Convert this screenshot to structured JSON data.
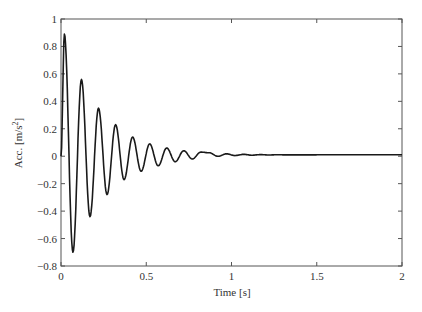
{
  "chart_data": {
    "type": "line",
    "title": "",
    "xlabel": "Time [s]",
    "ylabel": "Acc. [m/s²]",
    "ylabel_base": "Acc. [m/s",
    "ylabel_sup": "2",
    "ylabel_tail": "]",
    "xlim": [
      0,
      2
    ],
    "ylim": [
      -0.8,
      1
    ],
    "xticks": [
      0,
      0.5,
      1,
      1.5,
      2
    ],
    "xtick_labels": [
      "0",
      "0.5",
      "1",
      "1.5",
      "2"
    ],
    "yticks": [
      -0.8,
      -0.6,
      -0.4,
      -0.2,
      0,
      0.2,
      0.4,
      0.6,
      0.8,
      1
    ],
    "ytick_labels": [
      "−0.8",
      "−0.6",
      "−0.4",
      "−0.2",
      "0",
      "0.2",
      "0.4",
      "0.6",
      "0.8",
      "1"
    ],
    "grid": false,
    "legend": null,
    "line_color": "#1a1a1a",
    "series": [
      {
        "name": "acceleration",
        "description": "damped oscillation, period ≈ 0.1 s, settles to ≈ 0.01",
        "peaks": [
          {
            "x": 0.02,
            "y": 0.89
          },
          {
            "x": 0.12,
            "y": 0.56
          },
          {
            "x": 0.22,
            "y": 0.35
          },
          {
            "x": 0.32,
            "y": 0.23
          },
          {
            "x": 0.42,
            "y": 0.14
          },
          {
            "x": 0.52,
            "y": 0.09
          },
          {
            "x": 0.62,
            "y": 0.06
          },
          {
            "x": 0.72,
            "y": 0.04
          },
          {
            "x": 0.82,
            "y": 0.03
          }
        ],
        "troughs": [
          {
            "x": 0.07,
            "y": -0.7
          },
          {
            "x": 0.17,
            "y": -0.44
          },
          {
            "x": 0.27,
            "y": -0.28
          },
          {
            "x": 0.37,
            "y": -0.17
          },
          {
            "x": 0.47,
            "y": -0.11
          },
          {
            "x": 0.57,
            "y": -0.07
          },
          {
            "x": 0.67,
            "y": -0.04
          },
          {
            "x": 0.77,
            "y": -0.02
          }
        ],
        "final_value": 0.01,
        "x_end": 2
      }
    ]
  },
  "plot_area": {
    "left": 61,
    "top": 19,
    "right": 402,
    "bottom": 266
  }
}
